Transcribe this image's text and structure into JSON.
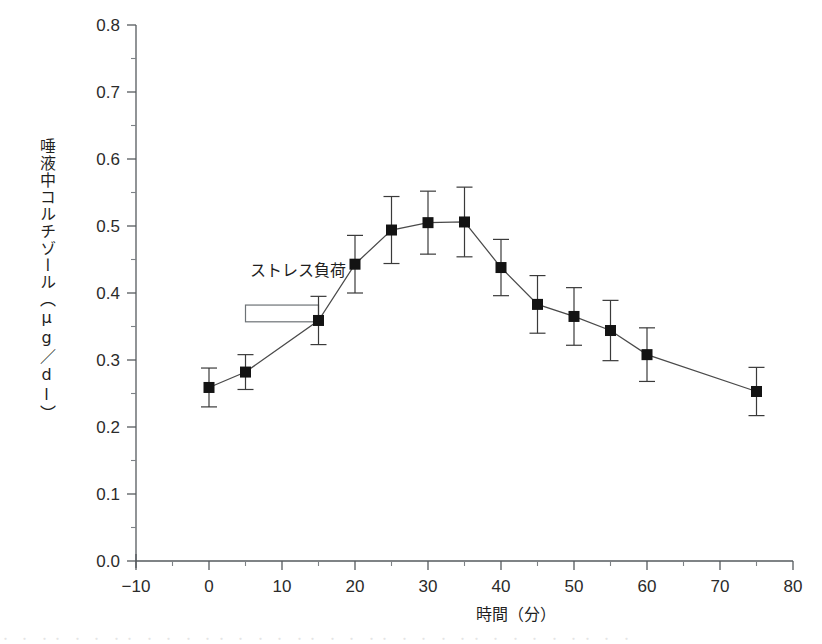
{
  "chart_data": {
    "type": "line",
    "title": "",
    "xlabel": "時間（分）",
    "ylabel": "唾液中コルチゾール（μg／dl）",
    "xlim": [
      -10,
      80
    ],
    "ylim": [
      0.0,
      0.8
    ],
    "grid": false,
    "legend": null,
    "x_ticks": [
      -10,
      0,
      10,
      20,
      30,
      40,
      50,
      60,
      70,
      80
    ],
    "x_tick_labels": [
      "−10",
      "0",
      "10",
      "20",
      "30",
      "40",
      "50",
      "60",
      "70",
      "80"
    ],
    "x_minor_interval": 5,
    "y_ticks": [
      0.0,
      0.1,
      0.2,
      0.3,
      0.4,
      0.5,
      0.6,
      0.7,
      0.8
    ],
    "y_tick_labels": [
      "0.0",
      "0.1",
      "0.2",
      "0.3",
      "0.4",
      "0.5",
      "0.6",
      "0.7",
      "0.8"
    ],
    "y_minor_interval": 0.05,
    "x": [
      0,
      5,
      15,
      20,
      25,
      30,
      35,
      40,
      45,
      50,
      55,
      60,
      75
    ],
    "values": [
      0.259,
      0.282,
      0.359,
      0.443,
      0.494,
      0.505,
      0.506,
      0.438,
      0.383,
      0.365,
      0.344,
      0.308,
      0.253
    ],
    "errors": [
      0.029,
      0.026,
      0.036,
      0.043,
      0.05,
      0.047,
      0.052,
      0.042,
      0.043,
      0.043,
      0.045,
      0.04,
      0.036
    ],
    "marker": "square",
    "marker_color": "#131313",
    "line_color": "#4a4a4a",
    "annotations": [
      {
        "text": "ストレス負荷",
        "text_x": 5,
        "text_y": 0.425,
        "box_x_start": 5,
        "box_x_end": 15,
        "box_y_top": 0.382,
        "box_y_bottom": 0.357
      }
    ]
  },
  "figure": {
    "background": "#ffffff",
    "axis_color": "#555a5e",
    "text_color": "#1f1f1f"
  },
  "scan_artifact": {
    "text": "・ ・  ・・ ・  ・ ・・  ・ ・ ・  ・・  ・ ・  ・  ・・ ・  ・ ・・ ・  ・  ・ ・・  ・ ・ ・  ・  ・・  ・ ・"
  }
}
